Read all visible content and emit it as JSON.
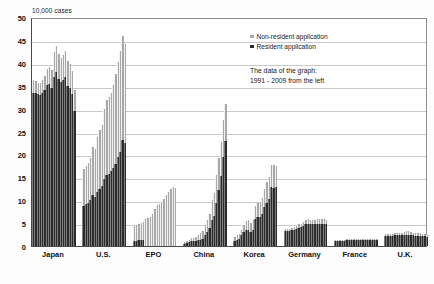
{
  "chart_data": {
    "type": "bar",
    "title": "",
    "subtitle": "",
    "ylabel": "10,000 cases",
    "xlabel": "",
    "ylim": [
      0,
      50
    ],
    "ytick_step": 5,
    "yticks": [
      "0",
      "5",
      "10",
      "15",
      "20",
      "25",
      "30",
      "35",
      "40",
      "45",
      "50"
    ],
    "grid": true,
    "stacked": true,
    "legend_position": "top-right",
    "annotation": {
      "line1": "The data of the graph:",
      "line2": "1991 - 2009 from the left"
    },
    "legend": [
      {
        "name": "Non-resident application",
        "color": "#a8a8a8"
      },
      {
        "name": "Resident application",
        "color": "#2b2b2b"
      }
    ],
    "series": [
      {
        "name": "Resident application",
        "color": "#2b2b2b"
      },
      {
        "name": "Non-resident application",
        "color": "#a8a8a8"
      }
    ],
    "categories": [
      "Japan",
      "U.S.",
      "EPO",
      "China",
      "Korea",
      "Germany",
      "France",
      "U.K."
    ],
    "years": [
      1991,
      1992,
      1993,
      1994,
      1995,
      1996,
      1997,
      1998,
      1999,
      2000,
      2001,
      2002,
      2003,
      2004,
      2005,
      2006,
      2007,
      2008,
      2009
    ],
    "groups": [
      {
        "category": "Japan",
        "resident": [
          33.5,
          33.4,
          33.2,
          32.9,
          33.4,
          34.0,
          35.1,
          35.3,
          34.6,
          37.0,
          38.1,
          36.5,
          35.8,
          36.3,
          36.8,
          35.0,
          34.4,
          33.1,
          29.5
        ],
        "nonresident": [
          2.8,
          2.6,
          2.5,
          2.6,
          2.8,
          3.2,
          3.5,
          3.7,
          3.9,
          5.3,
          5.6,
          5.4,
          5.3,
          5.4,
          5.7,
          5.5,
          5.3,
          5.1,
          4.6
        ]
      },
      {
        "category": "U.S.",
        "resident": [
          8.8,
          9.2,
          9.5,
          10.0,
          11.2,
          10.7,
          11.9,
          12.5,
          13.0,
          14.7,
          15.5,
          15.8,
          16.3,
          17.0,
          18.0,
          19.4,
          20.6,
          23.1,
          22.5
        ],
        "nonresident": [
          8.0,
          8.3,
          8.7,
          9.3,
          10.5,
          10.4,
          11.8,
          12.8,
          13.5,
          15.2,
          16.3,
          16.7,
          17.2,
          18.2,
          19.6,
          20.7,
          21.9,
          22.7,
          21.7
        ]
      },
      {
        "category": "EPO",
        "resident": [
          1.2,
          1.2,
          1.3,
          1.3,
          1.3,
          0.0,
          0.0,
          0.0,
          0.0,
          0.0,
          0.0,
          0.0,
          0.0,
          0.0,
          0.0,
          0.0,
          0.0,
          0.0,
          0.0
        ],
        "nonresident": [
          3.3,
          3.4,
          3.5,
          3.7,
          3.9,
          5.9,
          6.1,
          6.4,
          6.9,
          8.0,
          9.0,
          9.2,
          9.6,
          10.3,
          11.2,
          11.9,
          12.4,
          12.9,
          12.6
        ]
      },
      {
        "category": "China",
        "resident": [
          0.5,
          0.6,
          0.8,
          1.1,
          1.0,
          1.1,
          1.3,
          1.4,
          1.6,
          2.5,
          3.0,
          4.0,
          5.7,
          6.5,
          9.3,
          12.2,
          15.3,
          19.5,
          22.9
        ],
        "nonresident": [
          0.3,
          0.4,
          0.5,
          0.7,
          0.7,
          0.9,
          1.2,
          1.5,
          1.7,
          2.1,
          2.7,
          3.1,
          4.3,
          5.1,
          6.1,
          7.0,
          7.5,
          8.0,
          8.2
        ]
      },
      {
        "category": "Korea",
        "resident": [
          1.2,
          1.4,
          1.6,
          2.4,
          3.0,
          3.4,
          3.5,
          3.1,
          3.6,
          6.0,
          6.4,
          6.3,
          6.9,
          8.5,
          9.5,
          10.3,
          12.8,
          12.7,
          12.8
        ],
        "nonresident": [
          0.8,
          0.9,
          1.0,
          1.2,
          1.6,
          2.0,
          2.1,
          2.0,
          2.1,
          2.7,
          3.0,
          3.2,
          3.5,
          4.0,
          4.5,
          4.8,
          5.0,
          4.9,
          4.6
        ]
      },
      {
        "category": "Germany",
        "resident": [
          3.2,
          3.2,
          3.3,
          3.4,
          3.5,
          3.7,
          4.0,
          4.2,
          4.4,
          4.7,
          4.9,
          4.8,
          4.7,
          4.8,
          4.8,
          4.8,
          4.8,
          4.9,
          4.7
        ],
        "nonresident": [
          0.5,
          0.5,
          0.5,
          0.5,
          0.6,
          0.6,
          0.7,
          0.7,
          0.8,
          0.9,
          0.9,
          0.9,
          0.9,
          0.9,
          1.0,
          1.0,
          1.0,
          1.0,
          0.9
        ]
      },
      {
        "category": "France",
        "resident": [
          1.2,
          1.2,
          1.2,
          1.2,
          1.2,
          1.3,
          1.3,
          1.3,
          1.3,
          1.4,
          1.4,
          1.4,
          1.4,
          1.4,
          1.4,
          1.4,
          1.4,
          1.4,
          1.4
        ],
        "nonresident": [
          0.2,
          0.2,
          0.2,
          0.2,
          0.2,
          0.2,
          0.2,
          0.2,
          0.2,
          0.2,
          0.2,
          0.2,
          0.2,
          0.2,
          0.2,
          0.2,
          0.2,
          0.2,
          0.2
        ]
      },
      {
        "category": "U.K.",
        "resident": [
          2.2,
          2.2,
          2.2,
          2.2,
          2.3,
          2.3,
          2.3,
          2.3,
          2.4,
          2.5,
          2.5,
          2.4,
          2.3,
          2.2,
          2.2,
          2.2,
          2.1,
          2.1,
          1.9
        ],
        "nonresident": [
          0.5,
          0.5,
          0.5,
          0.5,
          0.5,
          0.6,
          0.6,
          0.6,
          0.7,
          0.7,
          0.7,
          0.7,
          0.6,
          0.6,
          0.6,
          0.6,
          0.6,
          0.5,
          0.5
        ]
      }
    ]
  }
}
